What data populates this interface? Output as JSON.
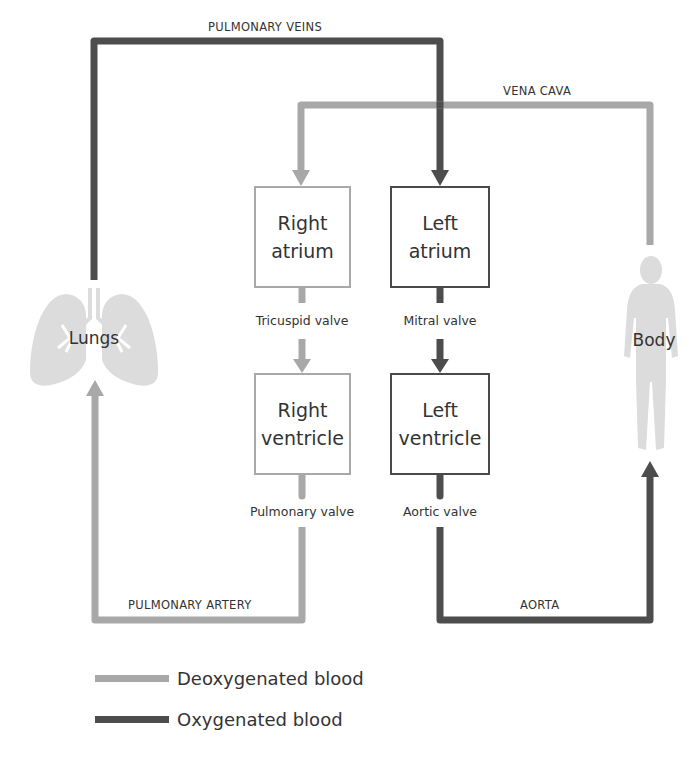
{
  "colors": {
    "deoxygenated": "#a8a8a8",
    "oxygenated": "#4d4d4d",
    "organ_fill": "#dcdcdc"
  },
  "vessels": {
    "pulmonary_veins": "PULMONARY VEINS",
    "vena_cava": "VENA CAVA",
    "pulmonary_artery": "PULMONARY ARTERY",
    "aorta": "AORTA"
  },
  "chambers": {
    "right_atrium": {
      "line1": "Right",
      "line2": "atrium"
    },
    "left_atrium": {
      "line1": "Left",
      "line2": "atrium"
    },
    "right_ventricle": {
      "line1": "Right",
      "line2": "ventricle"
    },
    "left_ventricle": {
      "line1": "Left",
      "line2": "ventricle"
    }
  },
  "valves": {
    "tricuspid": "Tricuspid valve",
    "mitral": "Mitral valve",
    "pulmonary": "Pulmonary valve",
    "aortic": "Aortic valve"
  },
  "organs": {
    "lungs": "Lungs",
    "body": "Body"
  },
  "legend": [
    {
      "label": "Deoxygenated blood",
      "key": "deoxygenated"
    },
    {
      "label": "Oxygenated blood",
      "key": "oxygenated"
    }
  ]
}
